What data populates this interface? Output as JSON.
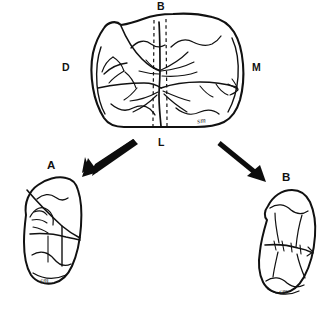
{
  "figure": {
    "caption": "",
    "background_color": "#ffffff",
    "ink_color": "#111111"
  },
  "main_view": {
    "name": "occlusal-view-of-molar",
    "orientation_labels": {
      "top": "B",
      "left": "D",
      "right": "M",
      "bottom": "L"
    },
    "signature": "sm",
    "section_line_style": "dashed"
  },
  "arrows": {
    "left": {
      "label": "arrow-to-section-a"
    },
    "right": {
      "label": "arrow-to-section-b"
    }
  },
  "panels": [
    {
      "id": "a",
      "label": "A",
      "name": "section-view-a",
      "signature": "sm"
    },
    {
      "id": "b",
      "label": "B",
      "name": "section-view-b",
      "signature": "sm"
    }
  ]
}
